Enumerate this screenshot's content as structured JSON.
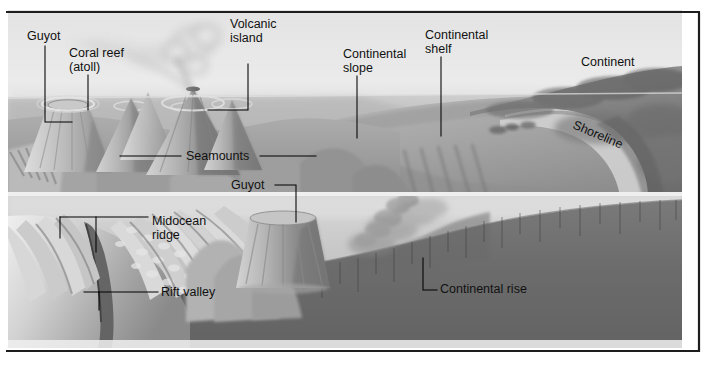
{
  "figure": {
    "width": 708,
    "height": 372,
    "style": "grayscale airbrush illustration",
    "frame": {
      "border_color": "#1a1a1a",
      "background_color": "#ffffff"
    }
  },
  "palette": {
    "sky": "#e9e9e9",
    "sky_low": "#f4f4f4",
    "ocean_surface": "#cfcfcf",
    "water_upper": "#bdbdbd",
    "water_lower": "#d4d4d4",
    "seafloor_light": "#b5b5b5",
    "seafloor_mid": "#9c9c9c",
    "seafloor_dark": "#7e7e7e",
    "ridge_highlight": "#e0e0e0",
    "abyss_dark": "#6a6a6a",
    "crust_dark": "#707070",
    "continent_dark": "#8a8a8a",
    "continent_darker": "#6f6f6f",
    "label_text": "#111111",
    "leader_line": "#000000"
  },
  "labels": [
    {
      "id": "guyot-top",
      "name": "guyot-upper-label",
      "text": "Guyot",
      "lines": [
        "Guyot"
      ],
      "x": 27,
      "y": 40,
      "anchor": "start",
      "rotated": false
    },
    {
      "id": "coral-reef",
      "name": "coral-reef-atoll-label",
      "text": "Coral reef (atoll)",
      "lines": [
        "Coral reef",
        "(atoll)"
      ],
      "x": 69,
      "y": 57,
      "anchor": "start",
      "rotated": false
    },
    {
      "id": "volcanic-island",
      "name": "volcanic-island-label",
      "text": "Volcanic island",
      "lines": [
        "Volcanic",
        "island"
      ],
      "x": 230,
      "y": 28,
      "anchor": "start",
      "rotated": false
    },
    {
      "id": "continental-slope",
      "name": "continental-slope-label",
      "text": "Continental slope",
      "lines": [
        "Continental",
        "slope"
      ],
      "x": 343,
      "y": 58,
      "anchor": "start",
      "rotated": false
    },
    {
      "id": "continental-shelf",
      "name": "continental-shelf-label",
      "text": "Continental shelf",
      "lines": [
        "Continental",
        "shelf"
      ],
      "x": 425,
      "y": 39,
      "anchor": "start",
      "rotated": false
    },
    {
      "id": "continent",
      "name": "continent-label",
      "text": "Continent",
      "lines": [
        "Continent"
      ],
      "x": 581,
      "y": 66,
      "anchor": "start",
      "rotated": false
    },
    {
      "id": "shoreline",
      "name": "shoreline-label",
      "text": "Shoreline",
      "lines": [
        "Shoreline"
      ],
      "x": 572,
      "y": 128,
      "anchor": "start",
      "rotated": true,
      "rotation_deg": 23
    },
    {
      "id": "seamounts",
      "name": "seamounts-label",
      "text": "Seamounts",
      "lines": [
        "Seamounts"
      ],
      "x": 186,
      "y": 160,
      "anchor": "start",
      "rotated": false
    },
    {
      "id": "guyot-mid",
      "name": "guyot-lower-label",
      "text": "Guyot",
      "lines": [
        "Guyot"
      ],
      "x": 231,
      "y": 189,
      "anchor": "start",
      "rotated": false
    },
    {
      "id": "midocean-ridge",
      "name": "midocean-ridge-label",
      "text": "Midocean ridge",
      "lines": [
        "Midocean",
        "ridge"
      ],
      "x": 152,
      "y": 225,
      "anchor": "start",
      "rotated": false
    },
    {
      "id": "rift-valley",
      "name": "rift-valley-label",
      "text": "Rift valley",
      "lines": [
        "Rift valley"
      ],
      "x": 161,
      "y": 296,
      "anchor": "start",
      "rotated": false
    },
    {
      "id": "continental-rise",
      "name": "continental-rise-label",
      "text": "Continental rise",
      "lines": [
        "Continental rise"
      ],
      "x": 440,
      "y": 293,
      "anchor": "start",
      "rotated": false
    }
  ],
  "features": {
    "upper_panel": "Ocean surface with volcanic island emitting ash plume, guyot with flat top, coral reef atoll, seamounts rising from seafloor, continental shelf and slope leading to continent and shoreline",
    "lower_panel": "Cutaway of ocean crust showing midocean ridge with rift valley, guyot, and continental rise over dark abyssal crust"
  }
}
